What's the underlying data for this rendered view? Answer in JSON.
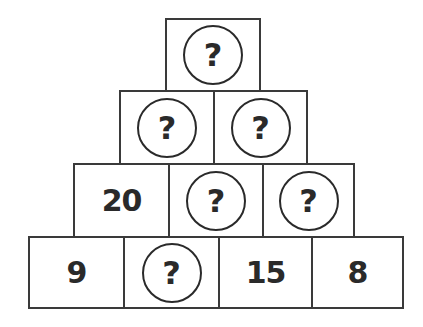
{
  "puzzle": {
    "type": "number-pyramid",
    "rows": [
      {
        "cells": [
          {
            "value": "?",
            "unknown": true
          }
        ]
      },
      {
        "cells": [
          {
            "value": "?",
            "unknown": true
          },
          {
            "value": "?",
            "unknown": true
          }
        ]
      },
      {
        "cells": [
          {
            "value": "20",
            "unknown": false
          },
          {
            "value": "?",
            "unknown": true
          },
          {
            "value": "?",
            "unknown": true
          }
        ]
      },
      {
        "cells": [
          {
            "value": "9",
            "unknown": false
          },
          {
            "value": "?",
            "unknown": true
          },
          {
            "value": "15",
            "unknown": false
          },
          {
            "value": "8",
            "unknown": false
          }
        ]
      }
    ]
  },
  "colors": {
    "line": "#3a3a3a",
    "text": "#2a2a2a",
    "background": "#ffffff"
  }
}
